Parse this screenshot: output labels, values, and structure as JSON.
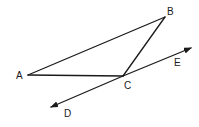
{
  "diagram": {
    "type": "geometry",
    "points": {
      "A": {
        "label": "A",
        "x": 28,
        "y": 75
      },
      "B": {
        "label": "B",
        "x": 165,
        "y": 17
      },
      "C": {
        "label": "C",
        "x": 123,
        "y": 76
      },
      "D": {
        "label": "D",
        "x": 51,
        "y": 107
      },
      "E": {
        "label": "E",
        "x": 191,
        "y": 48
      }
    },
    "segments": [
      {
        "from": "A",
        "to": "B"
      },
      {
        "from": "B",
        "to": "C"
      },
      {
        "from": "A",
        "to": "C"
      }
    ],
    "rays": [
      {
        "from": "C",
        "to": "D",
        "arrow": true
      },
      {
        "from": "C",
        "to": "E",
        "arrow": true
      }
    ],
    "labels": {
      "A": "A",
      "B": "B",
      "C": "C",
      "D": "D",
      "E": "E"
    },
    "colors": {
      "stroke": "#1a1a1a",
      "background": "#ffffff"
    }
  }
}
